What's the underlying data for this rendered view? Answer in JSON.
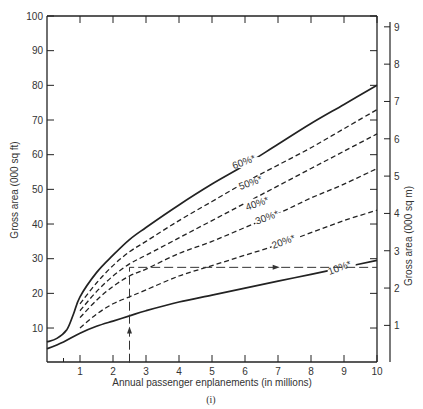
{
  "chart_data": {
    "type": "line",
    "title": "",
    "caption": "(i)",
    "xlabel": "Annual passenger enplanements (in millions)",
    "ylabel": "Gross area (000 sq ft)",
    "ylabel_right": "Gross area (000 sq m)",
    "xlim": [
      0,
      10
    ],
    "ylim": [
      0,
      100
    ],
    "ylim_right": [
      0,
      9.29
    ],
    "x_ticks": [
      1,
      2,
      3,
      4,
      5,
      6,
      7,
      8,
      9,
      10
    ],
    "y_ticks": [
      10,
      20,
      30,
      40,
      50,
      60,
      70,
      80,
      90,
      100
    ],
    "y_ticks_right": [
      1,
      2,
      3,
      4,
      5,
      6,
      7,
      8,
      9
    ],
    "grid": false,
    "series": [
      {
        "name": "60%*",
        "style": "solid",
        "label_at": [
          6.0,
          57
        ],
        "x": [
          0,
          0.3,
          0.6,
          0.8,
          1,
          1.5,
          2,
          2.5,
          3,
          4,
          5,
          6,
          7,
          8,
          9,
          10
        ],
        "y": [
          6,
          7,
          9.5,
          14,
          19,
          26,
          31,
          35.5,
          39,
          45.5,
          51.5,
          57,
          63,
          69,
          74.5,
          80
        ]
      },
      {
        "name": "50%*",
        "style": "dashed",
        "label_at": [
          6.2,
          51
        ],
        "x": [
          1,
          1.5,
          2,
          2.5,
          3,
          4,
          5,
          6,
          7,
          8,
          9,
          10
        ],
        "y": [
          17,
          23,
          28,
          32,
          35,
          41,
          46.5,
          52,
          57,
          62,
          67.5,
          73
        ]
      },
      {
        "name": "40%*",
        "style": "dashed",
        "label_at": [
          6.4,
          45
        ],
        "x": [
          1,
          1.5,
          2,
          2.5,
          3,
          4,
          5,
          6,
          7,
          8,
          9,
          10
        ],
        "y": [
          15,
          20.5,
          25,
          28.5,
          31,
          36,
          41,
          46,
          51,
          56,
          61,
          66
        ]
      },
      {
        "name": "30%*",
        "style": "dashed",
        "label_at": [
          6.7,
          41
        ],
        "x": [
          1,
          1.5,
          2,
          2.5,
          3,
          4,
          5,
          6,
          7,
          8,
          9,
          10
        ],
        "y": [
          13,
          18,
          22,
          25,
          27,
          31.5,
          35,
          39,
          43,
          47.5,
          51.5,
          56
        ]
      },
      {
        "name": "20%*",
        "style": "dashed",
        "label_at": [
          7.2,
          34
        ],
        "x": [
          1,
          1.5,
          2,
          2.5,
          3,
          4,
          5,
          6,
          7,
          8,
          9,
          10
        ],
        "y": [
          10,
          14,
          17,
          19,
          21,
          25,
          28,
          31,
          34,
          37.5,
          41,
          44
        ]
      },
      {
        "name": "10%*",
        "style": "solid",
        "label_at": [
          8.9,
          26.5
        ],
        "x": [
          0,
          0.5,
          1,
          1.5,
          2,
          2.5,
          3,
          4,
          5,
          6,
          7,
          8,
          9,
          10
        ],
        "y": [
          4,
          6,
          8.5,
          10.5,
          12,
          13.5,
          15,
          17.5,
          19.5,
          21.5,
          23.5,
          25.5,
          27.5,
          29.5
        ]
      }
    ],
    "annotations": [
      {
        "type": "guide-line",
        "style": "long-dash",
        "points": [
          [
            2.5,
            0
          ],
          [
            2.5,
            27.5
          ],
          [
            10,
            27.5
          ]
        ],
        "arrows": [
          [
            2.5,
            9
          ],
          [
            6.9,
            27.5
          ]
        ]
      }
    ]
  }
}
